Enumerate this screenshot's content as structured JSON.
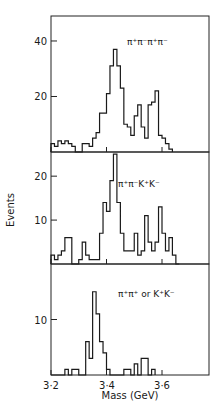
{
  "figure": {
    "ylabel": "Events",
    "xlabel": "Mass (GeV)",
    "xticks": [
      "3·2",
      "3·4",
      "3·6"
    ],
    "caption": "Fig. 11 ..."
  },
  "chart_data": [
    {
      "type": "bar",
      "title": "π⁺π⁻π⁺π⁻",
      "xlabel": "Mass (GeV)",
      "ylabel": "Events",
      "bin_width": 0.0125,
      "x_start": 3.2,
      "xlim": [
        3.2,
        3.77
      ],
      "ylim": [
        0,
        49
      ],
      "yticks": [
        20,
        40
      ],
      "values": [
        3,
        2,
        4,
        3,
        4,
        3,
        2,
        0,
        0,
        3,
        3,
        2,
        5,
        7,
        14,
        14,
        21,
        31,
        37,
        31,
        23,
        10,
        9,
        6,
        13,
        17,
        9,
        5,
        17,
        18,
        22,
        6,
        5,
        3,
        1
      ]
    },
    {
      "type": "bar",
      "title": "π⁺π⁻K⁺K⁻",
      "xlabel": "Mass (GeV)",
      "ylabel": "Events",
      "bin_width": 0.0125,
      "x_start": 3.2,
      "xlim": [
        3.2,
        3.77
      ],
      "ylim": [
        0,
        25.5
      ],
      "yticks": [
        10,
        20
      ],
      "values": [
        2,
        1,
        2,
        3,
        6,
        6,
        0,
        0,
        1,
        5,
        2,
        1,
        1,
        1,
        7,
        14,
        12,
        19,
        25,
        14,
        7,
        3,
        3,
        3,
        7,
        2,
        3,
        11,
        5,
        3,
        5,
        13,
        7,
        3,
        6,
        2,
        0
      ]
    },
    {
      "type": "bar",
      "title": "π⁺π⁺ or K⁺K⁻",
      "xlabel": "Mass (GeV)",
      "ylabel": "Events",
      "bin_width": 0.0125,
      "x_start": 3.2,
      "xlim": [
        3.2,
        3.77
      ],
      "ylim": [
        0,
        20
      ],
      "yticks": [
        10
      ],
      "values": [
        0,
        0,
        0,
        0,
        1,
        0,
        1,
        1,
        0,
        0,
        6,
        3,
        15,
        11,
        6,
        4,
        1,
        0,
        0,
        0,
        0,
        1,
        1,
        0,
        2,
        0,
        3,
        3,
        0,
        1
      ]
    }
  ]
}
